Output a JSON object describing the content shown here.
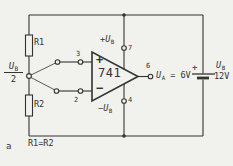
{
  "colors": {
    "background": "#f1f1ee",
    "line": "#333333"
  },
  "opamp": {
    "part": "741",
    "plus_input": "+",
    "minus_input": "−"
  },
  "pins": {
    "noninv": "3",
    "inv": "2",
    "vplus": "7",
    "vminus": "4",
    "out": "6"
  },
  "resistors": {
    "r1": "R1",
    "r2": "R2",
    "equation": "R1=R2"
  },
  "input_source": {
    "symbol": "U",
    "sub": "B",
    "denominator": "2"
  },
  "supply": {
    "plus_sign": "+",
    "minus_sign": "−",
    "symbol": "U",
    "sub": "B"
  },
  "output": {
    "symbol": "U",
    "sub": "A",
    "value": "= 6V"
  },
  "battery": {
    "plus": "+",
    "symbol": "U",
    "sub": "B",
    "voltage": "12V"
  },
  "figure_label": "a"
}
